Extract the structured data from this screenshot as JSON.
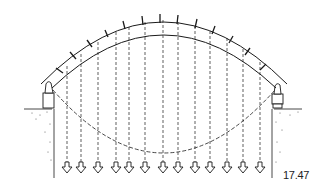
{
  "figure": {
    "label": "17.47",
    "arch": {
      "voussoir_count": 14,
      "left_support_x": 47,
      "right_support_x": 280,
      "crown_y": 14
    },
    "loads": {
      "count": 13,
      "x_positions": [
        67,
        81,
        98,
        116,
        129,
        145,
        163,
        178,
        195,
        210,
        227,
        243,
        260
      ]
    },
    "colors": {
      "ink": "#1a1a1a",
      "background": "#ffffff"
    }
  }
}
